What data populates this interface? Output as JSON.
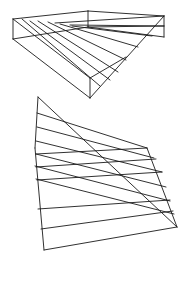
{
  "figure": {
    "stroke_color": "#1a1a1a",
    "background": "#ffffff",
    "top_figure": {
      "frame": [
        [
          [
            13,
            19
          ],
          [
            13,
            39
          ]
        ],
        [
          [
            13,
            19
          ],
          [
            88,
            11
          ]
        ],
        [
          [
            88,
            11
          ],
          [
            164,
            16
          ]
        ],
        [
          [
            164,
            16
          ],
          [
            164,
            37
          ]
        ],
        [
          [
            88,
            11
          ],
          [
            88,
            27
          ]
        ],
        [
          [
            13,
            39
          ],
          [
            90,
            98
          ]
        ],
        [
          [
            90,
            78
          ],
          [
            90,
            98
          ]
        ],
        [
          [
            90,
            98
          ],
          [
            164,
            16
          ]
        ],
        [
          [
            90,
            78
          ],
          [
            126,
            57
          ]
        ]
      ],
      "rulings": [
        [
          [
            13,
            19
          ],
          [
            90,
            78
          ]
        ],
        [
          [
            22,
            19
          ],
          [
            100,
            86
          ]
        ],
        [
          [
            30,
            21
          ],
          [
            110,
            80
          ]
        ],
        [
          [
            38,
            21
          ],
          [
            118,
            72
          ]
        ],
        [
          [
            48,
            22
          ],
          [
            126,
            60
          ]
        ],
        [
          [
            60,
            24
          ],
          [
            138,
            47
          ]
        ],
        [
          [
            72,
            26
          ],
          [
            152,
            36
          ]
        ],
        [
          [
            88,
            27
          ],
          [
            164,
            37
          ]
        ],
        [
          [
            13,
            39
          ],
          [
            88,
            27
          ]
        ],
        [
          [
            55,
            23
          ],
          [
            164,
            16
          ]
        ],
        [
          [
            70,
            25
          ],
          [
            164,
            26
          ]
        ],
        [
          [
            88,
            27
          ],
          [
            164,
            26
          ]
        ]
      ]
    },
    "bottom_figure": {
      "frame": [
        [
          [
            38,
            97
          ],
          [
            35,
            148
          ]
        ],
        [
          [
            35,
            148
          ],
          [
            44,
            250
          ]
        ],
        [
          [
            44,
            250
          ],
          [
            177,
            227
          ]
        ],
        [
          [
            177,
            227
          ],
          [
            147,
            148
          ]
        ],
        [
          [
            38,
            97
          ],
          [
            177,
            227
          ]
        ]
      ],
      "rulings": [
        [
          [
            37,
            113
          ],
          [
            147,
            148
          ]
        ],
        [
          [
            37,
            127
          ],
          [
            154,
            158
          ]
        ],
        [
          [
            36,
            141
          ],
          [
            162,
            172
          ]
        ],
        [
          [
            36,
            154
          ],
          [
            166,
            187
          ]
        ],
        [
          [
            35,
            166
          ],
          [
            170,
            201
          ]
        ],
        [
          [
            36,
            179
          ],
          [
            174,
            214
          ]
        ],
        [
          [
            38,
            209
          ],
          [
            170,
            200
          ]
        ],
        [
          [
            41,
            229
          ],
          [
            173,
            211
          ]
        ],
        [
          [
            36,
            167
          ],
          [
            156,
            159
          ]
        ],
        [
          [
            36,
            154
          ],
          [
            147,
            148
          ]
        ],
        [
          [
            37,
            180
          ],
          [
            162,
            172
          ]
        ]
      ]
    }
  }
}
